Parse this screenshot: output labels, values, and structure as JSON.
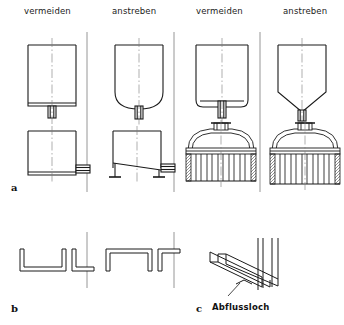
{
  "figure": {
    "line_color": "#1a1a1a",
    "fill_color": "#ffffff",
    "centerline_color": "#7a7a7a",
    "hatch_color": "#4a4a4a"
  },
  "headers": [
    {
      "label": "vermeiden",
      "x": 24,
      "y": 6
    },
    {
      "label": "anstreben",
      "x": 112,
      "y": 6
    },
    {
      "label": "vermeiden",
      "x": 196,
      "y": 6
    },
    {
      "label": "anstreben",
      "x": 283,
      "y": 6
    }
  ],
  "row_labels": [
    {
      "label": "a",
      "x": 11,
      "y": 182
    },
    {
      "label": "b",
      "x": 11,
      "y": 303
    },
    {
      "label": "c",
      "x": 196,
      "y": 303
    }
  ],
  "annotations": [
    {
      "label": "Abflussloch",
      "x": 212,
      "y": 302
    }
  ],
  "dividers": [
    {
      "x": 87,
      "y1": 32,
      "y2": 192
    },
    {
      "x": 174,
      "y1": 32,
      "y2": 192
    },
    {
      "x": 260,
      "y1": 32,
      "y2": 192
    },
    {
      "x": 87,
      "y1": 232,
      "y2": 288
    },
    {
      "x": 174,
      "y1": 232,
      "y2": 288
    }
  ],
  "row_a": {
    "upper": [
      {
        "name": "vessel-flat-bottom",
        "variant": "vermeiden",
        "bottom": "flat"
      },
      {
        "name": "vessel-dished-bottom",
        "variant": "anstreben",
        "bottom": "dished"
      },
      {
        "name": "vessel-flat-bottom-nozzle",
        "variant": "vermeiden",
        "bottom": "flat-short-nozzle"
      },
      {
        "name": "vessel-conical-bottom",
        "variant": "anstreben",
        "bottom": "conical"
      }
    ],
    "lower": [
      {
        "name": "tank-flat-floor",
        "variant": "vermeiden",
        "floor": "flat"
      },
      {
        "name": "tank-sloped-floor",
        "variant": "anstreben",
        "floor": "sloped"
      },
      {
        "name": "heat-exchanger-flat-tubesheet",
        "variant": "vermeiden",
        "tubes": 6
      },
      {
        "name": "heat-exchanger-drainable-tubesheet",
        "variant": "anstreben",
        "tubes": 6
      }
    ]
  },
  "row_b": {
    "profiles": [
      {
        "name": "channel-open-up-wide",
        "variant": "vermeiden",
        "orientation": "open-up"
      },
      {
        "name": "angle-open-up",
        "variant": "vermeiden",
        "orientation": "open-up"
      },
      {
        "name": "channel-open-down-wide",
        "variant": "anstreben",
        "orientation": "open-down"
      },
      {
        "name": "angle-open-down",
        "variant": "anstreben",
        "orientation": "open-down"
      }
    ]
  },
  "row_c": {
    "name": "isometric-channel-with-drain-hole",
    "description": "Isometrische Darstellung eines Profils an einer Wand mit Abflussloch"
  }
}
